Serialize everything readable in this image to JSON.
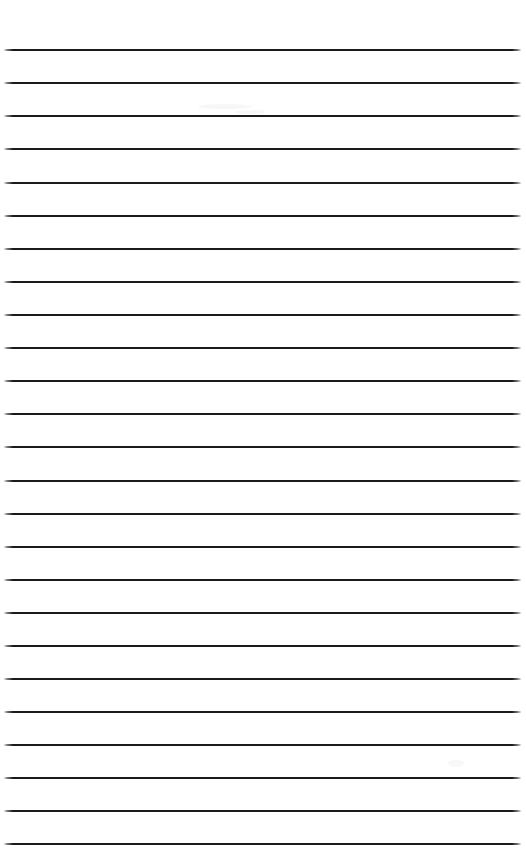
{
  "document": {
    "kind": "lined-paper",
    "title": "Blank Ruled Notebook Page",
    "width_px": 526,
    "height_px": 865,
    "background_color": "#ffffff",
    "has_text_content": false,
    "has_margin_rule": false,
    "has_punch_holes": false,
    "written_content": ""
  },
  "ruling": {
    "line_count": 25,
    "line_color": "#1a1a1a",
    "line_thickness_px": 2,
    "first_line_y_px": 49,
    "line_spacing_px": 33.05,
    "line_start_x_px": 4,
    "line_end_x_px": 521,
    "line_length_px": 517,
    "end_cap_style": "soft-fade",
    "orientation": "horizontal",
    "lines_y_px": [
      49,
      82,
      115,
      148,
      182,
      215,
      248,
      281,
      314,
      347,
      380,
      413,
      446,
      480,
      513,
      546,
      579,
      612,
      645,
      678,
      711,
      744,
      777,
      810,
      843
    ]
  },
  "smudges": [
    {
      "x_px": 198,
      "y_px": 104,
      "w_px": 54,
      "h_px": 5
    },
    {
      "x_px": 448,
      "y_px": 760,
      "w_px": 16,
      "h_px": 7
    },
    {
      "x_px": 236,
      "y_px": 110,
      "w_px": 30,
      "h_px": 4
    }
  ]
}
